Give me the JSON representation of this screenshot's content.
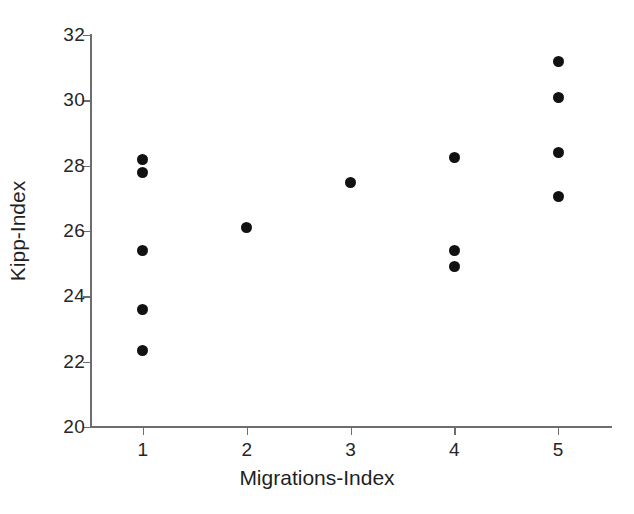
{
  "chart_data": {
    "type": "scatter",
    "title": "",
    "xlabel": "Migrations-Index",
    "ylabel": "Kipp-Index",
    "xlim": [
      0.5,
      5.5
    ],
    "ylim": [
      20,
      32
    ],
    "x_ticks": [
      1,
      2,
      3,
      4,
      5
    ],
    "x_ticklabels": [
      "1",
      "2",
      "3",
      "4",
      "5"
    ],
    "y_ticks": [
      20,
      22,
      24,
      26,
      28,
      30,
      32
    ],
    "y_ticklabels": [
      "20",
      "22",
      "24",
      "26",
      "28",
      "30",
      "32"
    ],
    "grid": false,
    "legend": false,
    "marker": "filled-circle",
    "marker_color": "#111111",
    "background_color": "#ffffff",
    "axis_color": "#6d6d6d",
    "points": [
      {
        "x": 1,
        "y": 28.2
      },
      {
        "x": 1,
        "y": 27.8
      },
      {
        "x": 1,
        "y": 25.4
      },
      {
        "x": 1,
        "y": 23.6
      },
      {
        "x": 1,
        "y": 22.35
      },
      {
        "x": 2,
        "y": 26.1
      },
      {
        "x": 3,
        "y": 27.5
      },
      {
        "x": 4,
        "y": 28.25
      },
      {
        "x": 4,
        "y": 25.4
      },
      {
        "x": 4,
        "y": 24.9
      },
      {
        "x": 5,
        "y": 31.2
      },
      {
        "x": 5,
        "y": 30.1
      },
      {
        "x": 5,
        "y": 28.4
      },
      {
        "x": 5,
        "y": 27.05
      }
    ]
  }
}
